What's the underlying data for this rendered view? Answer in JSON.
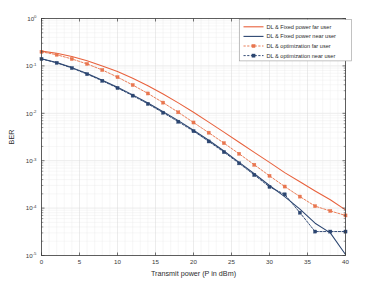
{
  "chart_data": {
    "type": "line",
    "title": "",
    "xlabel": "Transmit power (P in dBm)",
    "ylabel": "BER",
    "xlim": [
      0,
      40
    ],
    "ylim": [
      1e-05,
      1
    ],
    "yscale": "log",
    "xscale": "linear",
    "grid": true,
    "legend_position": "top-right",
    "xticks": [
      0,
      5,
      10,
      15,
      20,
      25,
      30,
      35,
      40
    ],
    "xtick_labels": [
      "0",
      "5",
      "10",
      "15",
      "20",
      "25",
      "30",
      "35",
      "40"
    ],
    "yticks": [
      1,
      0.1,
      0.01,
      0.001,
      0.0001,
      1e-05
    ],
    "ytick_labels": [
      "10^0",
      "10^-1",
      "10^-2",
      "10^-3",
      "10^-4",
      "10^-5"
    ],
    "x": [
      0,
      2,
      4,
      6,
      8,
      10,
      12,
      14,
      16,
      18,
      20,
      22,
      24,
      26,
      28,
      30,
      32,
      34,
      36,
      38,
      40
    ],
    "series": [
      {
        "name": "DL & Fixed power far user",
        "color": "#E8613C",
        "linestyle": "solid",
        "marker": "none",
        "values": [
          0.205,
          0.185,
          0.158,
          0.128,
          0.1,
          0.076,
          0.055,
          0.038,
          0.0255,
          0.0166,
          0.0105,
          0.0065,
          0.004,
          0.00245,
          0.0015,
          0.00092,
          0.00056,
          0.00036,
          0.00023,
          0.00015,
          9.2e-05
        ]
      },
      {
        "name": "DL & Fixed power near user",
        "color": "#2B4570",
        "linestyle": "solid",
        "marker": "none",
        "values": [
          0.142,
          0.118,
          0.092,
          0.069,
          0.05,
          0.0355,
          0.0245,
          0.0165,
          0.0108,
          0.007,
          0.0044,
          0.0027,
          0.0016,
          0.00092,
          0.00053,
          0.0003,
          0.000175,
          9.5e-05,
          4.8e-05,
          3e-05,
          1.05e-05
        ]
      },
      {
        "name": "DL & optimization far user",
        "color": "#E8764F",
        "linestyle": "dashed",
        "marker": "square",
        "values": [
          0.198,
          0.172,
          0.14,
          0.11,
          0.082,
          0.058,
          0.0395,
          0.0262,
          0.0168,
          0.0105,
          0.0064,
          0.0039,
          0.00235,
          0.0014,
          0.00082,
          0.00048,
          0.000285,
          0.000175,
          0.00011,
          8.7e-05,
          7e-05
        ]
      },
      {
        "name": "DL & optimization near user",
        "color": "#2B4570",
        "linestyle": "dashed",
        "marker": "square",
        "values": [
          0.14,
          0.116,
          0.09,
          0.067,
          0.0485,
          0.0342,
          0.0236,
          0.0158,
          0.0103,
          0.00665,
          0.0042,
          0.00255,
          0.00152,
          0.00088,
          0.0005,
          0.00028,
          0.000195,
          8e-05,
          3.2e-05,
          3.2e-05,
          3.2e-05
        ]
      }
    ]
  },
  "legend": {
    "items": [
      {
        "label": "DL & Fixed power far user"
      },
      {
        "label": "DL & Fixed power near user"
      },
      {
        "label": "DL & optimization far user"
      },
      {
        "label": "DL & optimization near user"
      }
    ]
  }
}
